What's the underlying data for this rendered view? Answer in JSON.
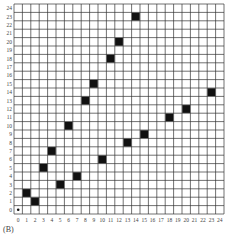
{
  "chart_data": {
    "type": "scatter",
    "title": "",
    "panel_label": "(B)",
    "xlabel": "",
    "ylabel": "",
    "xlim": [
      0,
      24
    ],
    "ylim": [
      0,
      24
    ],
    "grid": true,
    "x_ticks": [
      0,
      1,
      2,
      3,
      4,
      5,
      6,
      7,
      8,
      9,
      10,
      11,
      12,
      13,
      14,
      15,
      16,
      17,
      18,
      19,
      20,
      21,
      22,
      23,
      24
    ],
    "y_ticks": [
      0,
      1,
      2,
      3,
      4,
      5,
      6,
      7,
      8,
      9,
      10,
      11,
      12,
      13,
      14,
      15,
      16,
      17,
      18,
      19,
      20,
      21,
      22,
      23,
      24
    ],
    "origin_marker": {
      "x": 0,
      "y": 0,
      "style": "dot"
    },
    "series": [
      {
        "name": "upper",
        "marker": "filled-square",
        "points": [
          [
            1,
            2
          ],
          [
            3,
            5
          ],
          [
            4,
            7
          ],
          [
            6,
            10
          ],
          [
            8,
            13
          ],
          [
            9,
            15
          ],
          [
            11,
            18
          ],
          [
            12,
            20
          ],
          [
            14,
            23
          ]
        ]
      },
      {
        "name": "lower",
        "marker": "filled-square",
        "points": [
          [
            2,
            1
          ],
          [
            5,
            3
          ],
          [
            7,
            4
          ],
          [
            10,
            6
          ],
          [
            13,
            8
          ],
          [
            15,
            9
          ],
          [
            18,
            11
          ],
          [
            20,
            12
          ],
          [
            23,
            14
          ]
        ]
      }
    ],
    "colors": {
      "grid": "#333333",
      "marker": "#111111",
      "background": "#ffffff"
    }
  }
}
